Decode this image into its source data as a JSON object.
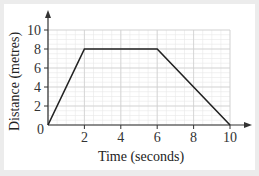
{
  "chart_data": {
    "type": "line",
    "title": "",
    "xlabel": "Time (seconds)",
    "ylabel": "Distance (metres)",
    "xlim": [
      0,
      10
    ],
    "ylim": [
      0,
      10
    ],
    "xticks": [
      0,
      2,
      4,
      6,
      8,
      10
    ],
    "yticks": [
      2,
      4,
      6,
      8,
      10
    ],
    "origin_label": "0",
    "grid": true,
    "legend": null,
    "series": [
      {
        "name": "distance",
        "x": [
          0,
          2,
          6,
          10
        ],
        "y": [
          0,
          8,
          8,
          0
        ]
      }
    ]
  },
  "colors": {
    "background": "#ececec",
    "panel": "#ffffff",
    "line": "#222222",
    "grid_major": "#cfcfcf",
    "grid_minor": "#e8e8e8",
    "axis": "#333333"
  }
}
